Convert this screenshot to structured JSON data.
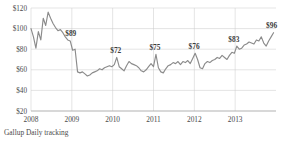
{
  "chart_data": {
    "type": "line",
    "title": "",
    "subtitle": "",
    "xlabel": "",
    "ylabel": "",
    "source_note": "Gallup Daily tracking",
    "grid": true,
    "legend": false,
    "legend_position": "none",
    "ylim": [
      20,
      120
    ],
    "xlim": [
      2008.0,
      2014.0
    ],
    "y_ticks": [
      120,
      100,
      80,
      60,
      40,
      20
    ],
    "y_tick_labels": [
      "$120",
      "$100",
      "$80",
      "$60",
      "$40",
      "$20"
    ],
    "x_ticks": [
      2008,
      2009,
      2010,
      2011,
      2012,
      2013
    ],
    "x_tick_labels": [
      "2008",
      "2009",
      "2010",
      "2011",
      "2012",
      "2013"
    ],
    "series_name": "Average daily spending",
    "line_color": "#8b8b8b",
    "grid_color": "#c9c9c9",
    "x": [
      2008.0,
      2008.06,
      2008.12,
      2008.18,
      2008.24,
      2008.3,
      2008.36,
      2008.42,
      2008.48,
      2008.54,
      2008.6,
      2008.66,
      2008.72,
      2008.78,
      2008.84,
      2008.9,
      2008.96,
      2009.02,
      2009.08,
      2009.14,
      2009.2,
      2009.26,
      2009.32,
      2009.38,
      2009.44,
      2009.5,
      2009.56,
      2009.62,
      2009.68,
      2009.74,
      2009.8,
      2009.86,
      2009.92,
      2009.98,
      2010.04,
      2010.1,
      2010.16,
      2010.22,
      2010.28,
      2010.34,
      2010.4,
      2010.46,
      2010.52,
      2010.58,
      2010.64,
      2010.7,
      2010.76,
      2010.82,
      2010.88,
      2010.94,
      2011.0,
      2011.06,
      2011.12,
      2011.18,
      2011.24,
      2011.3,
      2011.36,
      2011.42,
      2011.48,
      2011.54,
      2011.6,
      2011.66,
      2011.72,
      2011.78,
      2011.84,
      2011.9,
      2011.96,
      2012.02,
      2012.08,
      2012.14,
      2012.2,
      2012.26,
      2012.32,
      2012.38,
      2012.44,
      2012.5,
      2012.56,
      2012.62,
      2012.68,
      2012.74,
      2012.8,
      2012.86,
      2012.92,
      2012.98,
      2013.04,
      2013.1,
      2013.16,
      2013.22,
      2013.28,
      2013.34,
      2013.4,
      2013.46,
      2013.52,
      2013.58,
      2013.64,
      2013.7,
      2013.76,
      2013.82,
      2013.88,
      2013.94
    ],
    "values": [
      100,
      92,
      81,
      97,
      89,
      110,
      103,
      116,
      110,
      105,
      101,
      98,
      99,
      96,
      92,
      89,
      88,
      79,
      80,
      58,
      57,
      58,
      56,
      54,
      55,
      57,
      58,
      59,
      61,
      60,
      62,
      63,
      64,
      63,
      65,
      72,
      63,
      61,
      59,
      64,
      68,
      66,
      65,
      64,
      62,
      59,
      58,
      60,
      63,
      66,
      63,
      75,
      62,
      58,
      57,
      61,
      64,
      65,
      67,
      66,
      68,
      65,
      68,
      67,
      69,
      66,
      71,
      76,
      70,
      62,
      61,
      66,
      68,
      67,
      69,
      70,
      72,
      71,
      74,
      72,
      70,
      74,
      77,
      76,
      83,
      80,
      81,
      84,
      85,
      87,
      86,
      85,
      89,
      88,
      92,
      86,
      83,
      88,
      92,
      96
    ],
    "annotations": [
      {
        "label": "$89",
        "x": 2008.9,
        "y": 89
      },
      {
        "label": "$72",
        "x": 2010.1,
        "y": 72
      },
      {
        "label": "$75",
        "x": 2011.06,
        "y": 75
      },
      {
        "label": "$76",
        "x": 2012.02,
        "y": 76
      },
      {
        "label": "$83",
        "x": 2013.04,
        "y": 83
      },
      {
        "label": "$96",
        "x": 2013.94,
        "y": 96
      }
    ]
  }
}
